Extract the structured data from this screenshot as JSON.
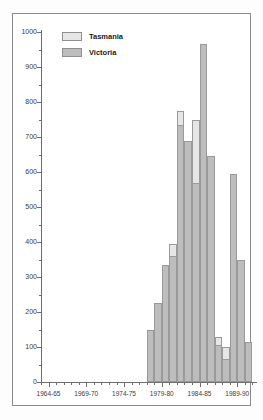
{
  "chart_data": {
    "type": "bar",
    "title": "",
    "subtitle": "",
    "xlabel": "",
    "ylabel": "",
    "stacked": true,
    "grid": false,
    "legend_position": "top-left",
    "ylim": [
      0,
      1000
    ],
    "ytick_step": 100,
    "yminor_step": 50,
    "xlim_labels": [
      "1964-65",
      "1969-70",
      "1974-75",
      "1979-80",
      "1984-85",
      "1989-90"
    ],
    "xtick_labels": [
      "1964-65",
      "1969-70",
      "1974-75",
      "1979-80",
      "1984-85",
      "1989-90"
    ],
    "ytick_labels": [
      "0",
      "100",
      "200",
      "300",
      "400",
      "500",
      "600",
      "700",
      "800",
      "900",
      "1000"
    ],
    "categories": [
      "1977-78",
      "1978-79",
      "1979-80",
      "1980-81",
      "1981-82",
      "1982-83",
      "1983-84",
      "1984-85",
      "1985-86",
      "1986-87",
      "1987-88",
      "1988-89",
      "1989-90",
      "1990-91"
    ],
    "series": [
      {
        "name": "Tasmania",
        "color": "#e6e6e6",
        "values": [
          150,
          225,
          335,
          395,
          775,
          690,
          750,
          965,
          645,
          130,
          100,
          595,
          350,
          115
        ]
      },
      {
        "name": "Victoria",
        "color": "#bdbdbd",
        "values": [
          150,
          225,
          335,
          360,
          735,
          690,
          570,
          965,
          645,
          105,
          65,
          595,
          350,
          115
        ]
      }
    ],
    "annotations": []
  },
  "legend": {
    "items": [
      {
        "label": "Tasmania",
        "swatch": "tas"
      },
      {
        "label": "Victoria",
        "swatch": "vic"
      }
    ]
  },
  "axes": {
    "y": {
      "ticks": [
        {
          "value": 1000,
          "label": "1000"
        },
        {
          "value": 900,
          "label": "900"
        },
        {
          "value": 800,
          "label": "800"
        },
        {
          "value": 700,
          "label": "700"
        },
        {
          "value": 600,
          "label": "600"
        },
        {
          "value": 500,
          "label": "500"
        },
        {
          "value": 400,
          "label": "400"
        },
        {
          "value": 300,
          "label": "300"
        },
        {
          "value": 200,
          "label": "200"
        },
        {
          "value": 100,
          "label": "100"
        },
        {
          "value": 0,
          "label": "0"
        }
      ]
    },
    "x": {
      "ticks": [
        {
          "label": "1964-65"
        },
        {
          "label": "1969-70"
        },
        {
          "label": "1974-75"
        },
        {
          "label": "1979-80"
        },
        {
          "label": "1984-85"
        },
        {
          "label": "1989-90"
        }
      ]
    }
  }
}
